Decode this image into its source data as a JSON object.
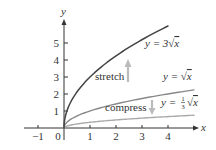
{
  "chart_data": {
    "type": "line",
    "title": "",
    "xlabel": "x",
    "ylabel": "y",
    "xlim": [
      -1.5,
      5.3
    ],
    "ylim": [
      -0.8,
      6.4
    ],
    "grid": false,
    "x_ticks": [
      -1,
      0,
      1,
      2,
      3,
      4
    ],
    "y_ticks": [
      1,
      2,
      3,
      4,
      5
    ],
    "x_tick_labels": [
      "−1",
      "0",
      "1",
      "2",
      "3",
      "4"
    ],
    "y_tick_labels": [
      "1",
      "2",
      "3",
      "4",
      "5"
    ],
    "series": [
      {
        "name": "y = 3√x",
        "color": "#444444",
        "x": [
          0,
          0.25,
          0.5,
          1,
          1.5,
          2,
          2.5,
          3,
          3.5,
          4
        ],
        "values": [
          0,
          1.5,
          2.12,
          3,
          3.67,
          4.24,
          4.74,
          5.2,
          5.61,
          6
        ]
      },
      {
        "name": "y = √x",
        "color": "#888888",
        "x": [
          0,
          0.5,
          1,
          2,
          3,
          4,
          5
        ],
        "values": [
          0,
          0.71,
          1,
          1.41,
          1.73,
          2,
          2.24
        ]
      },
      {
        "name": "y = ⅓√x",
        "color": "#aaaaaa",
        "x": [
          0,
          0.5,
          1,
          2,
          3,
          4,
          5
        ],
        "values": [
          0,
          0.24,
          0.33,
          0.47,
          0.58,
          0.67,
          0.75
        ]
      }
    ],
    "annotations": [
      {
        "text": "stretch",
        "arrow": "up",
        "x": 2.4,
        "y": 3.0
      },
      {
        "text": "compress",
        "arrow": "down",
        "x": 2.9,
        "y": 1.2
      }
    ]
  },
  "labels": {
    "x_axis": "x",
    "y_axis": "y",
    "ticks_x": [
      "−1",
      "0",
      "1",
      "2",
      "3",
      "4"
    ],
    "ticks_y": [
      "1",
      "2",
      "3",
      "4",
      "5"
    ],
    "eq_stretch_prefix": "y = 3",
    "eq_base_prefix": "y = ",
    "eq_compress_prefix": "y = ",
    "eq_compress_num": "1",
    "eq_compress_den": "3",
    "sqrt_symbol": "√",
    "sqrt_var": "x",
    "stretch": "stretch",
    "compress": "compress"
  },
  "colors": {
    "curve_stretch": "#444444",
    "curve_base": "#888888",
    "curve_compress": "#aaaaaa",
    "arrow": "#bbbbbb",
    "axis": "#333333"
  }
}
